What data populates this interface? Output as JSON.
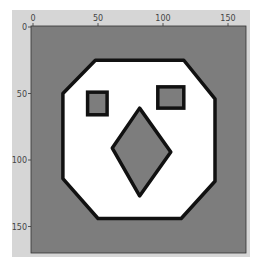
{
  "chart_data": {
    "type": "heatmap",
    "title": "",
    "xlabel": "",
    "ylabel": "",
    "xlim": [
      0,
      165
    ],
    "ylim": [
      165,
      0
    ],
    "grid": false,
    "legend": null,
    "x_ticks": [
      0,
      50,
      100,
      150
    ],
    "y_ticks": [
      0,
      50,
      100,
      150
    ],
    "x_tick_position": "top",
    "colors": {
      "figure_background": "#d6d6d6",
      "image_background": "#7d7d7d",
      "face_fill": "#ffffff",
      "outline": "#111111",
      "features_fill": "#7d7d7d"
    },
    "shapes": {
      "face_octagon": [
        [
          48,
          25
        ],
        [
          116,
          25
        ],
        [
          140,
          54
        ],
        [
          140,
          116
        ],
        [
          114,
          144
        ],
        [
          50,
          144
        ],
        [
          23,
          114
        ],
        [
          23,
          50
        ]
      ],
      "left_eye": {
        "x": [
          42,
          57
        ],
        "y": [
          49,
          66
        ]
      },
      "right_eye": {
        "x": [
          96,
          116
        ],
        "y": [
          45,
          61
        ]
      },
      "nose_diamond": [
        [
          82,
          61
        ],
        [
          106,
          94
        ],
        [
          82,
          127
        ],
        [
          61,
          91
        ]
      ]
    }
  },
  "axes": {
    "x_tick_labels": [
      "0",
      "50",
      "100",
      "150"
    ],
    "y_tick_labels": [
      "0",
      "50",
      "100",
      "150"
    ]
  }
}
